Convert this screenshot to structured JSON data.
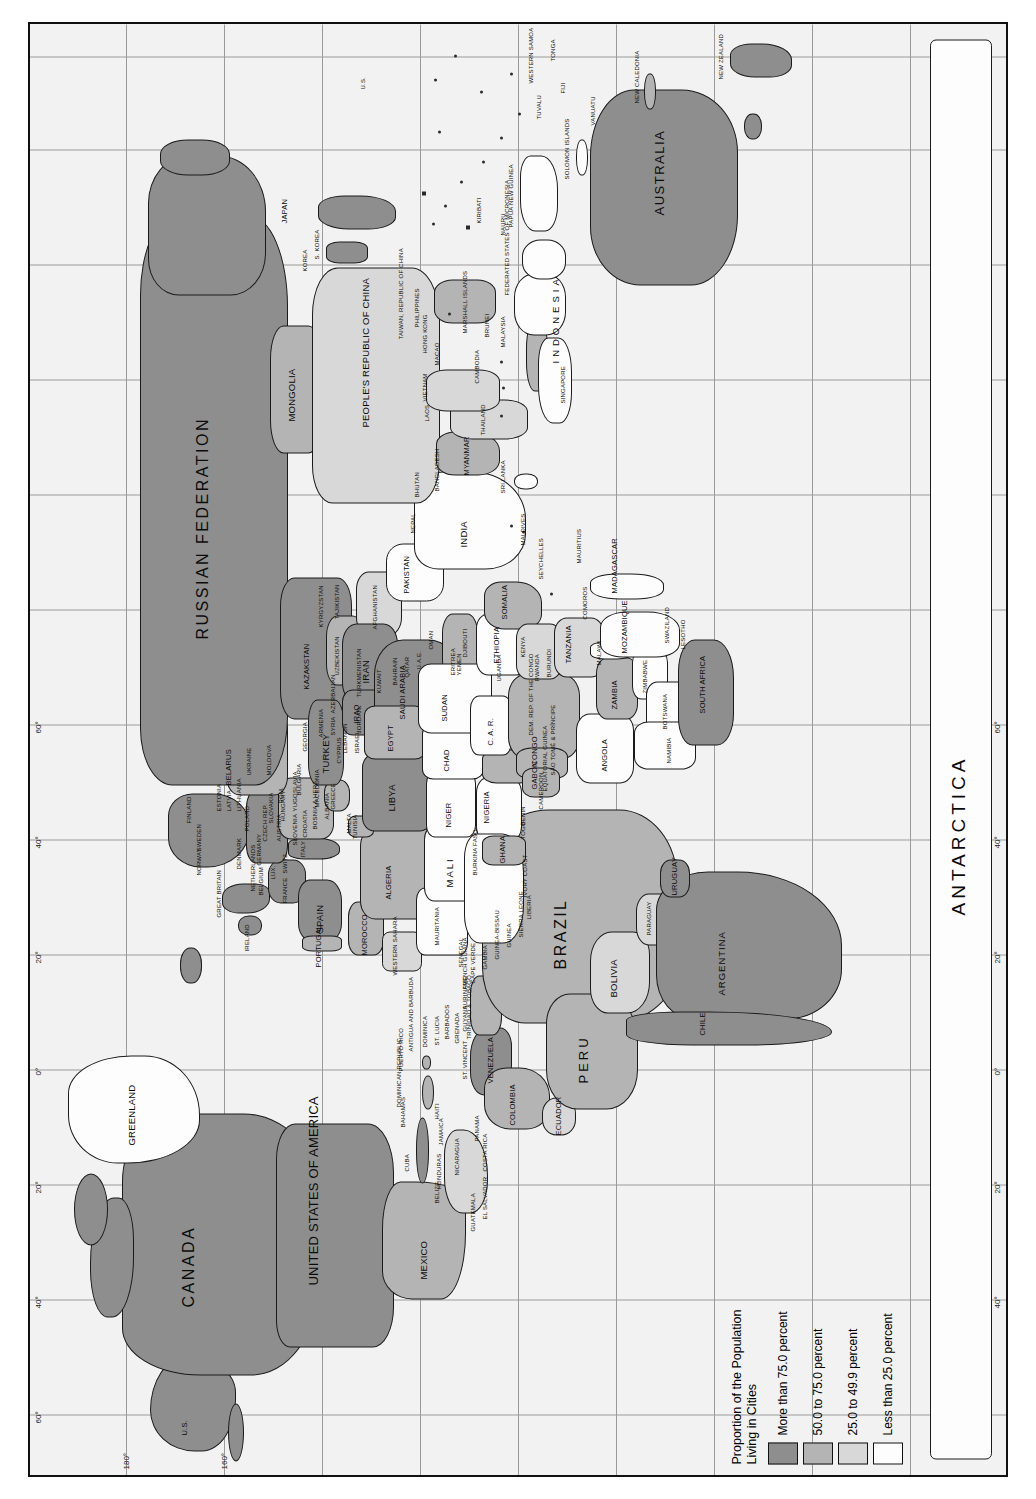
{
  "map": {
    "title": "World map of proportion of population living in cities",
    "projection_note": "rotated 90 degrees",
    "ocean_color": "#f2f2f2",
    "border_color": "#111111"
  },
  "legend": {
    "title_line1": "Proportion of the Population",
    "title_line2": "Living in Cities",
    "entries": [
      {
        "label": "More than 75.0 percent",
        "color": "#8e8e8e"
      },
      {
        "label": "50.0 to 75.0 percent",
        "color": "#b4b4b4"
      },
      {
        "label": "25.0 to 49.9 percent",
        "color": "#d8d8d8"
      },
      {
        "label": "Less than 25.0 percent",
        "color": "#fdfdfd"
      }
    ]
  },
  "graticule": {
    "longitude_ticks_left": [
      "180°",
      "160°"
    ],
    "latitude_ticks_top": [
      "60°",
      "40°",
      "20°",
      "0°",
      "20°",
      "40°",
      "60°"
    ],
    "latitude_ticks_bottom": [
      "40°",
      "20°",
      "0°",
      "20°",
      "40°",
      "60°"
    ],
    "longitude_ticks_other": [
      "160°",
      "140°",
      "120°",
      "100°",
      "80°",
      "60°",
      "40°",
      "20°",
      "0°",
      "20°",
      "40°",
      "60°"
    ]
  },
  "labels": {
    "continents": [
      "ANTARCTICA"
    ],
    "north_america": [
      "U.S.",
      "CANADA",
      "UNITED STATES OF AMERICA",
      "GREENLAND",
      "MEXICO",
      "BELIZE",
      "GUATEMALA",
      "EL SALVADOR",
      "HONDURAS",
      "NICARAGUA",
      "COSTA RICA",
      "PANAMA",
      "CUBA",
      "BAHAMAS",
      "JAMAICA",
      "HAITI",
      "DOMINICAN REPUBLIC",
      "PUERTO RICO",
      "ANTIGUA AND BARBUDA",
      "DOMINICA",
      "ST. LUCIA",
      "BARBADOS",
      "GRENADA",
      "ST. VINCENT",
      "TRINIDAD & TOBAGO"
    ],
    "south_america": [
      "COLOMBIA",
      "VENEZUELA",
      "GUYANA",
      "SURINAME",
      "FRENCH GUIANA",
      "ECUADOR",
      "PERU",
      "BRAZIL",
      "BOLIVIA",
      "PARAGUAY",
      "CHILE",
      "ARGENTINA",
      "URUGUAY"
    ],
    "europe": [
      "GREAT BRITAIN",
      "IRELAND",
      "PORTUGAL",
      "SPAIN",
      "FRANCE",
      "BELGIUM",
      "NETHERLANDS",
      "LUX.",
      "SWITZ.",
      "ITALY",
      "GERMANY",
      "DENMARK",
      "NORWAY",
      "SWEDEN",
      "FINLAND",
      "ESTONIA",
      "LATVIA",
      "LITHUANIA",
      "BELARUS",
      "POLAND",
      "CZECH REP.",
      "SLOVAKIA",
      "AUSTRIA",
      "HUNGARY",
      "SLOVENIA",
      "CROATIA",
      "BOSNIA & HERZ.",
      "YUGOSLAVIA",
      "ALBANIA",
      "MACEDONIA",
      "ROM.",
      "BULGARIA",
      "GREECE",
      "MALTA",
      "UKRAINE",
      "MOLDOVA",
      "CYPRUS"
    ],
    "middle_east": [
      "TURKEY",
      "SYRIA",
      "LEBANON",
      "ISRAEL",
      "JORDAN",
      "IRAQ",
      "IRAN",
      "KUWAIT",
      "SAUDI ARABIA",
      "BAHRAIN",
      "QATAR",
      "U.A.E.",
      "OMAN",
      "YEMEN",
      "GEORGIA",
      "ARMENIA",
      "AZERBAIJAN"
    ],
    "asia": [
      "RUSSIAN FEDERATION",
      "KAZAKSTAN",
      "UZBEKISTAN",
      "TURKMENISTAN",
      "KYRGYZSTAN",
      "TAJIKISTAN",
      "AFGHANISTAN",
      "PAKISTAN",
      "INDIA",
      "NEPAL",
      "BHUTAN",
      "BANGLADESH",
      "SRI LANKA",
      "MALDIVES",
      "MONGOLIA",
      "PEOPLE'S REPUBLIC OF CHINA",
      "KOREA",
      "S. KOREA",
      "JAPAN",
      "TAIWAN, REPUBLIC OF CHINA",
      "HONG KONG",
      "MACAO",
      "MYANMAR",
      "THAILAND",
      "LAOS",
      "VIETNAM",
      "CAMBODIA",
      "MALAYSIA",
      "SINGAPORE",
      "BRUNEI",
      "PHILIPPINES",
      "INDONESIA"
    ],
    "africa": [
      "MOROCCO",
      "WESTERN SAHARA",
      "ALGERIA",
      "TUNISIA",
      "LIBYA",
      "EGYPT",
      "MAURITANIA",
      "MALI",
      "NIGER",
      "CHAD",
      "SUDAN",
      "ERITREA",
      "DJIBOUTI",
      "ETHIOPIA",
      "SOMALIA",
      "SENEGAL",
      "CAPE VERDE",
      "GAMBIA",
      "GUINEA-BISSAU",
      "GUINEA",
      "SIERRA LEONE",
      "LIBERIA",
      "IVORY COAST",
      "BURKINA FASO",
      "GHANA",
      "TOGO",
      "BENIN",
      "NIGERIA",
      "CAMEROON",
      "EQUATORIAL GUINEA",
      "SÃO TOMÉ & PRÍNCIPE",
      "GABON",
      "CONGO",
      "C. A. R.",
      "DEM. REP. OF THE CONGO",
      "UGANDA",
      "KENYA",
      "RWANDA",
      "BURUNDI",
      "TANZANIA",
      "ANGOLA",
      "ZAMBIA",
      "MALAWI",
      "MOZAMBIQUE",
      "ZIMBABWE",
      "BOTSWANA",
      "NAMIBIA",
      "SOUTH AFRICA",
      "SWAZILAND",
      "LESOTHO",
      "MADAGASCAR",
      "COMOROS",
      "MAURITIUS",
      "SEYCHELLES"
    ],
    "oceania": [
      "AUSTRALIA",
      "NEW ZEALAND",
      "PAPUA NEW GUINEA",
      "SOLOMON ISLANDS",
      "VANUATU",
      "NEW CALEDONIA",
      "FIJI",
      "TONGA",
      "WESTERN SAMOA",
      "TUVALU",
      "KIRIBATI",
      "NAURU",
      "MARSHALL ISLANDS",
      "FEDERATED STATES OF MICRONESIA"
    ]
  }
}
